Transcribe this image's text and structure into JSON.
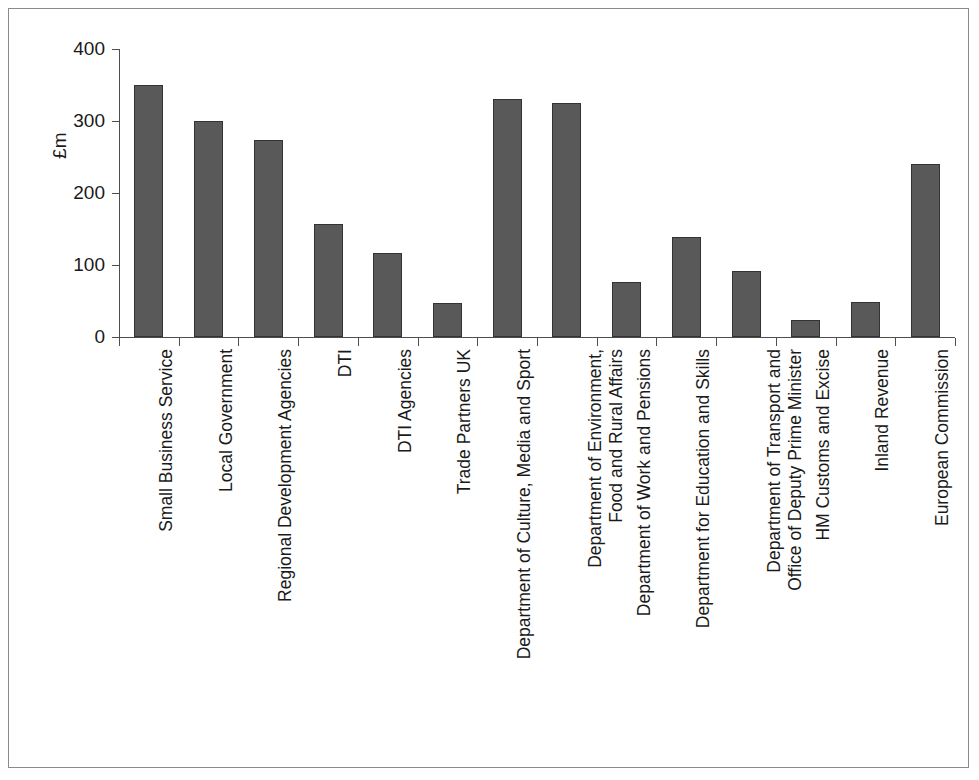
{
  "chart_data": {
    "type": "bar",
    "title": "",
    "xlabel": "",
    "ylabel": "£m",
    "ylim": [
      0,
      400
    ],
    "yticks": [
      0,
      100,
      200,
      300,
      400
    ],
    "grid": false,
    "legend": null,
    "bar_color": "#595959",
    "bar_edge_color": "#333333",
    "categories": [
      "Small Business Service",
      "Local Government",
      "Regional Development Agencies",
      "DTI",
      "DTI Agencies",
      "Trade Partners UK",
      "Department of Culture, Media and Sport",
      "Department of Environment, Food and Rural Affairs",
      "Department of Work and Pensions",
      "Department for Education and Skills",
      "Department of Transport and Office of Deputy Prime Minister",
      "HM Customs and Excise",
      "Inland Revenue",
      "European Commission"
    ],
    "category_lines": [
      [
        "Small Business Service"
      ],
      [
        "Local Government"
      ],
      [
        "Regional Development Agencies"
      ],
      [
        "DTI"
      ],
      [
        "DTI Agencies"
      ],
      [
        "Trade Partners UK"
      ],
      [
        "Department of Culture, Media and Sport"
      ],
      [
        "Department of Environment,",
        "Food and Rural Affairs"
      ],
      [
        "Department of Work and Pensions"
      ],
      [
        "Department for Education and Skills"
      ],
      [
        "Department of Transport and",
        "Office of Deputy Prime Minister"
      ],
      [
        "HM Customs and Excise"
      ],
      [
        "Inland Revenue"
      ],
      [
        "European Commission"
      ]
    ],
    "values": [
      350,
      300,
      274,
      157,
      117,
      47,
      330,
      325,
      76,
      139,
      91,
      23,
      49,
      240
    ]
  }
}
